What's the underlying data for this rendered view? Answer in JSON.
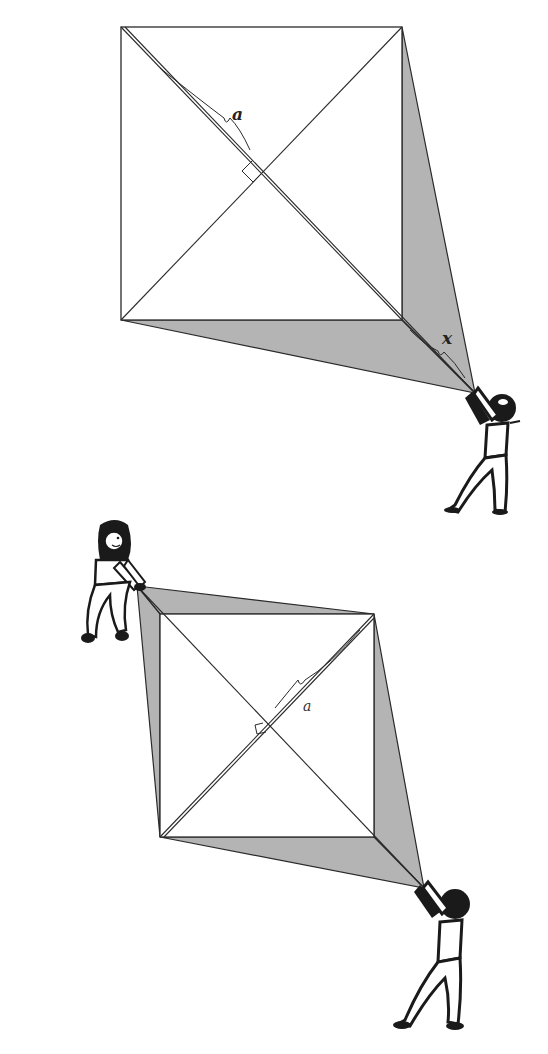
{
  "colors": {
    "shade": "#b4b4b4",
    "line": "#2a2a2a",
    "figure": "#1a1a1a",
    "background": "#ffffff"
  },
  "top_diagram": {
    "label_a": "a",
    "label_x": "x",
    "square": {
      "tl": [
        121,
        27
      ],
      "tr": [
        402,
        27
      ],
      "br": [
        402,
        320
      ],
      "bl": [
        121,
        320
      ]
    },
    "apex": [
      475,
      393
    ]
  },
  "bottom_diagram": {
    "label_a": "a",
    "square": {
      "tl": [
        160,
        614
      ],
      "tr": [
        374,
        614
      ],
      "br": [
        374,
        837
      ],
      "bl": [
        160,
        837
      ]
    },
    "apex_top_left": [
      137,
      586
    ],
    "apex_bottom_right": [
      424,
      888
    ]
  },
  "figures": [
    {
      "name": "person-pulling-top",
      "position": [
        475,
        440
      ]
    },
    {
      "name": "girl-pulling-bottom-left",
      "position": [
        108,
        575
      ]
    },
    {
      "name": "person-pulling-bottom-right",
      "position": [
        440,
        950
      ]
    }
  ]
}
